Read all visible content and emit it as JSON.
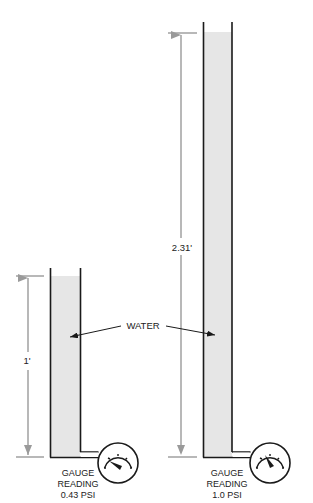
{
  "colors": {
    "water": "#e6e6e6",
    "tube": "#1a1a1a",
    "dimension": "#9a9a9a",
    "text": "#222222"
  },
  "shared_label": "WATER",
  "columns": [
    {
      "id": "short",
      "height_label": "1'",
      "height_ft": 1,
      "gauge_line1": "GAUGE",
      "gauge_line2": "READING",
      "gauge_reading": "0.43 PSI"
    },
    {
      "id": "tall",
      "height_label": "2.31'",
      "height_ft": 2.31,
      "gauge_line1": "GAUGE",
      "gauge_line2": "READING",
      "gauge_reading": "1.0 PSI"
    }
  ]
}
